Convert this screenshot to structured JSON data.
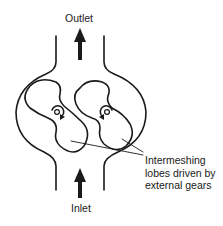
{
  "diagram": {
    "labels": {
      "outlet": "Outlet",
      "inlet": "Inlet",
      "lobes": "Intermeshing\nlobes driven by\nexternal gears"
    },
    "components": [
      {
        "name": "casing",
        "description": "rounded pump housing with top and bottom pipe necks"
      },
      {
        "name": "lobe-left",
        "center": [
          58,
          112
        ],
        "rotation": "clockwise"
      },
      {
        "name": "lobe-right",
        "center": [
          107,
          112
        ],
        "rotation": "counterclockwise"
      },
      {
        "name": "outlet-arrow",
        "direction": "up"
      },
      {
        "name": "inlet-arrow",
        "direction": "up"
      }
    ],
    "colors": {
      "stroke": "#1a1a1a",
      "background": "#ffffff"
    }
  }
}
